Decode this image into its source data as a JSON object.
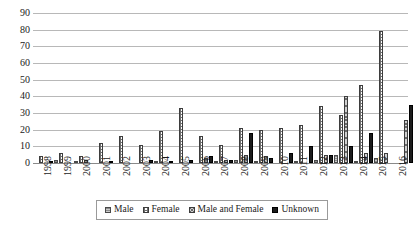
{
  "chart_data": {
    "type": "bar",
    "title": "",
    "subtitle": "",
    "xlabel": "",
    "ylabel": "",
    "ylim": [
      0,
      90
    ],
    "ytick_step": 10,
    "yticks": [
      90,
      80,
      70,
      60,
      50,
      40,
      30,
      20,
      10,
      0
    ],
    "grid": true,
    "legend_position": "bottom",
    "categories": [
      "1998",
      "1999",
      "2000",
      "2001",
      "2002",
      "2003",
      "2004",
      "2005",
      "2006",
      "2007",
      "2008",
      "2009",
      "2010",
      "2011",
      "2012",
      "2013",
      "2014",
      "2015",
      "2016"
    ],
    "series": [
      {
        "name": "Male",
        "pattern": "solid-gray",
        "values": [
          0,
          2,
          1,
          0,
          0,
          0,
          1,
          0,
          0,
          1,
          2,
          1,
          0,
          1,
          2,
          5,
          1,
          3,
          0
        ]
      },
      {
        "name": "Female",
        "pattern": "grid-hatch",
        "values": [
          4,
          6,
          4,
          12,
          16,
          11,
          19,
          33,
          16,
          11,
          21,
          20,
          21,
          23,
          34,
          29,
          47,
          79,
          0
        ]
      },
      {
        "name": "Male and Female",
        "pattern": "cross-diagonal",
        "values": [
          0,
          0,
          2,
          0,
          0,
          0,
          0,
          0,
          3,
          2,
          5,
          4,
          0,
          0,
          5,
          40,
          6,
          6,
          26
        ]
      },
      {
        "name": "Unknown",
        "pattern": "solid-black",
        "values": [
          1,
          0,
          0,
          1,
          0,
          2,
          1,
          2,
          4,
          2,
          18,
          3,
          6,
          10,
          5,
          10,
          18,
          0,
          35
        ]
      }
    ]
  },
  "legend": {
    "items": [
      {
        "label": "Male"
      },
      {
        "label": "Female"
      },
      {
        "label": "Male and Female"
      },
      {
        "label": "Unknown"
      }
    ]
  },
  "colors": {
    "male": "#8c8c8c",
    "female": "#ffffff",
    "male_and_female": "#d0d0d0",
    "unknown": "#1c1c1c",
    "gridline": "#b8b8b8",
    "text": "#1a1a1a",
    "background": "#ffffff"
  }
}
